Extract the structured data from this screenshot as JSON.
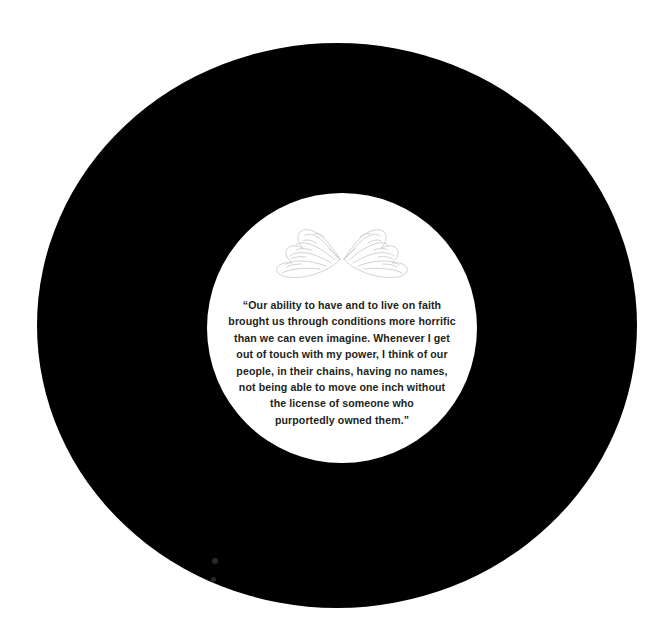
{
  "canvas": {
    "width": 668,
    "height": 637,
    "background_color": "#ffffff"
  },
  "outer_disc": {
    "name": "black-circle",
    "color": "#000000",
    "left": 37,
    "top": 43,
    "width": 600,
    "height": 565
  },
  "inner_disc": {
    "name": "white-circle",
    "color": "#ffffff",
    "left": 207,
    "top": 193,
    "diameter": 270
  },
  "artwork": {
    "icon_name": "angel-wings-icon",
    "stroke_color": "#c9c9c9",
    "description": "pair of outlined angel wings, mirrored, meeting at center"
  },
  "quote": {
    "text_color": "#231f20",
    "lines": [
      "“Our ability to have and to live on faith",
      "brought us through conditions more horrific",
      "than we can even imagine. Whenever I get",
      "out of touch with my power, I think of our",
      "people, in their chains, having no names,",
      "not being able to move one inch without",
      "the license of someone who",
      "purportedly owned them.”"
    ],
    "full_text": "“Our ability to have and to live on faith brought us through conditions more horrific than we can even imagine. Whenever I get out of touch with my power, I think of our people, in their chains, having no names, not being able to move one inch without the license of someone who purportedly owned them.”"
  },
  "specks": [
    {
      "name": "speck-upper",
      "left": 175,
      "top": 515,
      "size": 6
    },
    {
      "name": "speck-lower",
      "left": 174,
      "top": 534,
      "size": 5
    }
  ]
}
